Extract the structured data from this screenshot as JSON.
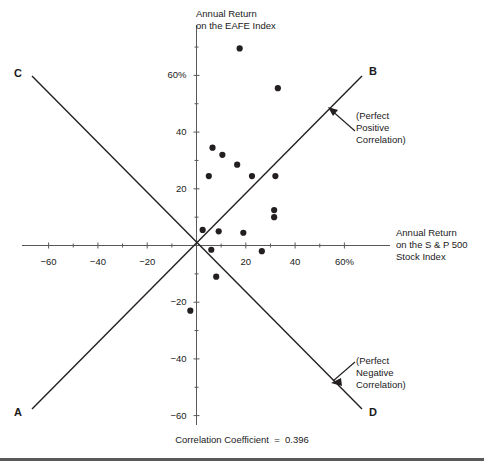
{
  "figure": {
    "title_y_axis": "Annual Return\non the EAFE Index",
    "title_y_axis_line1": "Annual Return",
    "title_y_axis_line2": "on the EAFE Index",
    "title_x_axis_line1": "Annual Return",
    "title_x_axis_line2": "on the S & P 500",
    "title_x_axis_line3": "Stock Index",
    "caption": "Correlation Coefficient  =  0.396",
    "line_labels": {
      "a": "A",
      "b": "B",
      "c": "C",
      "d": "D"
    },
    "annotation_positive_line1": "(Perfect",
    "annotation_positive_line2": "Positive",
    "annotation_positive_line3": "Correlation)",
    "annotation_negative_line1": "(Perfect",
    "annotation_negative_line2": "Negative",
    "annotation_negative_line3": "Correlation)",
    "colors": {
      "ink": "#1a1a1a",
      "point": "#231f20",
      "axis": "#58595b",
      "rule": "#58595b"
    }
  },
  "chart_data": {
    "type": "scatter",
    "title": "",
    "xlabel": "Annual Return on the S & P 500 Stock Index",
    "ylabel": "Annual Return on the EAFE Index",
    "xlim": [
      -70,
      70
    ],
    "ylim": [
      -70,
      72
    ],
    "grid": false,
    "legend": "none",
    "xticks": [
      -60,
      -50,
      -40,
      -30,
      -20,
      -10,
      0,
      10,
      20,
      30,
      40,
      50,
      60
    ],
    "xtick_labels": [
      "−60",
      "",
      "−40",
      "",
      "−20",
      "",
      "",
      "",
      "20",
      "",
      "40",
      "",
      "60%"
    ],
    "yticks": [
      -60,
      -50,
      -40,
      -30,
      -20,
      -10,
      0,
      10,
      20,
      30,
      40,
      50,
      60,
      70
    ],
    "ytick_labels": [
      "−60",
      "",
      "−40",
      "",
      "−20",
      "",
      "",
      "",
      "20",
      "",
      "40",
      "",
      "60%",
      ""
    ],
    "correlation_coefficient": 0.396,
    "points": [
      {
        "x": 17.5,
        "y": 69.5
      },
      {
        "x": 33.0,
        "y": 55.5
      },
      {
        "x": 6.5,
        "y": 34.5
      },
      {
        "x": 10.5,
        "y": 32.0
      },
      {
        "x": 16.5,
        "y": 28.5
      },
      {
        "x": 5.0,
        "y": 24.5
      },
      {
        "x": 22.5,
        "y": 24.5
      },
      {
        "x": 32.0,
        "y": 24.5
      },
      {
        "x": 31.5,
        "y": 12.5
      },
      {
        "x": 31.5,
        "y": 10.0
      },
      {
        "x": 2.5,
        "y": 5.5
      },
      {
        "x": 9.0,
        "y": 5.0
      },
      {
        "x": 19.0,
        "y": 4.5
      },
      {
        "x": 6.0,
        "y": -1.5
      },
      {
        "x": 26.5,
        "y": -2.0
      },
      {
        "x": 8.0,
        "y": -11.0
      },
      {
        "x": -2.5,
        "y": -23.0
      }
    ],
    "reference_lines": [
      {
        "name": "perfect-positive",
        "from_label": "A",
        "to_label": "B",
        "slope": 1,
        "annotation": "(Perfect Positive Correlation)"
      },
      {
        "name": "perfect-negative",
        "from_label": "C",
        "to_label": "D",
        "slope": -1,
        "annotation": "(Perfect Negative Correlation)"
      }
    ]
  }
}
